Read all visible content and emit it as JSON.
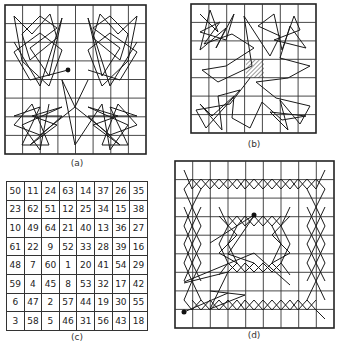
{
  "figure": {
    "panels": [
      {
        "id": "a",
        "caption": "(a)",
        "type": "knight-tour-diagram",
        "grid": "8x8"
      },
      {
        "id": "b",
        "caption": "(b)",
        "type": "knight-tour-diagram",
        "grid": "8x8",
        "center_cells_hatched": true
      },
      {
        "id": "c",
        "caption": "(c)",
        "type": "numbered-grid",
        "grid": "8x8"
      },
      {
        "id": "d",
        "caption": "(d)",
        "type": "knight-tour-diagram",
        "grid": "9x9"
      }
    ],
    "grid_c": {
      "rows": [
        [
          "50",
          "11",
          "24",
          "63",
          "14",
          "37",
          "26",
          "35"
        ],
        [
          "23",
          "62",
          "51",
          "12",
          "25",
          "34",
          "15",
          "38"
        ],
        [
          "10",
          "49",
          "64",
          "21",
          "40",
          "13",
          "36",
          "27"
        ],
        [
          "61",
          "22",
          "9",
          "52",
          "33",
          "28",
          "39",
          "16"
        ],
        [
          "48",
          "7",
          "60",
          "1",
          "20",
          "41",
          "54",
          "29"
        ],
        [
          "59",
          "4",
          "45",
          "8",
          "53",
          "32",
          "17",
          "42"
        ],
        [
          "6",
          "47",
          "2",
          "57",
          "44",
          "19",
          "30",
          "55"
        ],
        [
          "3",
          "58",
          "5",
          "46",
          "31",
          "56",
          "43",
          "18"
        ]
      ]
    },
    "colors": {
      "line": "#222222",
      "background": "#ffffff"
    }
  }
}
